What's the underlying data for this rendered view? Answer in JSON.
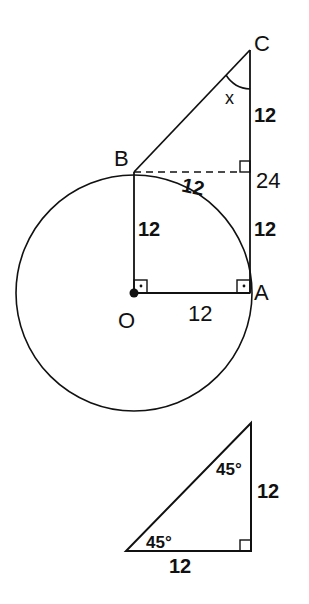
{
  "main_figure": {
    "points": {
      "C": "C",
      "B": "B",
      "A": "A",
      "O": "O"
    },
    "angle_label": "x",
    "labels": {
      "CD": "12",
      "BD_arc": "12",
      "total_CA": "24",
      "DA": "12",
      "OB": "12",
      "OA": "12"
    }
  },
  "reference_triangle": {
    "top_angle": "45°",
    "bottom_angle": "45°",
    "vertical_leg": "12",
    "horizontal_leg": "12"
  },
  "colors": {
    "stroke": "#111111",
    "background": "#ffffff"
  }
}
